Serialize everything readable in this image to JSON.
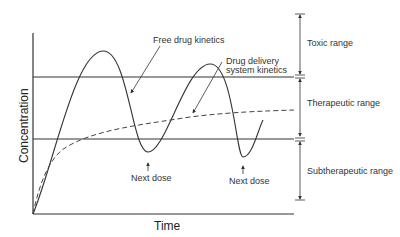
{
  "diagram": {
    "axes": {
      "x_label": "Time",
      "y_label": "Concentration"
    },
    "annotations": {
      "free_drug": "Free drug kinetics",
      "dds_line1": "Drug delivery",
      "dds_line2": "system kinetics",
      "next_dose_1": "Next dose",
      "next_dose_2": "Next dose"
    },
    "ranges": {
      "toxic": "Toxic range",
      "therapeutic": "Therapeutic range",
      "subtherapeutic": "Subtherapeutic range"
    },
    "colors": {
      "line": "#333333",
      "background": "#ffffff"
    }
  }
}
